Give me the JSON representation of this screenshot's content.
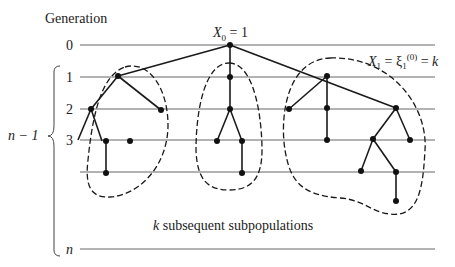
{
  "title": "Generation",
  "generation_labels": [
    "0",
    "1",
    "2",
    "3",
    "",
    "n"
  ],
  "brace_label": "n − 1",
  "root_annotation": {
    "var": "X",
    "sub": "0",
    "rest": " = 1"
  },
  "first_gen_annotation": {
    "var": "X",
    "sub": "1",
    "mid": " = ξ",
    "mid_sub": "1",
    "mid_sup": "(0)",
    "rest": " = ",
    "k": "k"
  },
  "caption": {
    "k": "k",
    "text": " subsequent subpopulations"
  },
  "trees": {
    "root": {
      "gen": 0
    },
    "subpopulations": [
      {
        "name": "left",
        "edges": [
          [
            1,
            2
          ],
          [
            1,
            2
          ],
          [
            2,
            3
          ],
          [
            2,
            3
          ],
          [
            3,
            4
          ]
        ]
      },
      {
        "name": "middle"
      },
      {
        "name": "right"
      }
    ]
  }
}
